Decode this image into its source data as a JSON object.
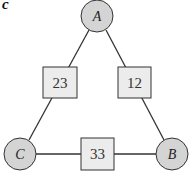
{
  "panel_label": "c",
  "colors": {
    "node_fill": "#d4d4d4",
    "box_fill": "#ececec",
    "stroke": "#333333"
  },
  "nodes": [
    {
      "id": "A",
      "label": "A",
      "cx": 97,
      "cy": 16,
      "r": 16
    },
    {
      "id": "B",
      "label": "B",
      "cx": 172,
      "cy": 154,
      "r": 16
    },
    {
      "id": "C",
      "label": "C",
      "cx": 20,
      "cy": 154,
      "r": 16
    }
  ],
  "edges": [
    {
      "from": "A",
      "to": "C",
      "weight": "23",
      "box": {
        "x": 43,
        "y": 67,
        "w": 34,
        "h": 31
      }
    },
    {
      "from": "A",
      "to": "B",
      "weight": "12",
      "box": {
        "x": 118,
        "y": 67,
        "w": 33,
        "h": 31
      }
    },
    {
      "from": "C",
      "to": "B",
      "weight": "33",
      "box": {
        "x": 81,
        "y": 138,
        "w": 33,
        "h": 32
      }
    }
  ]
}
